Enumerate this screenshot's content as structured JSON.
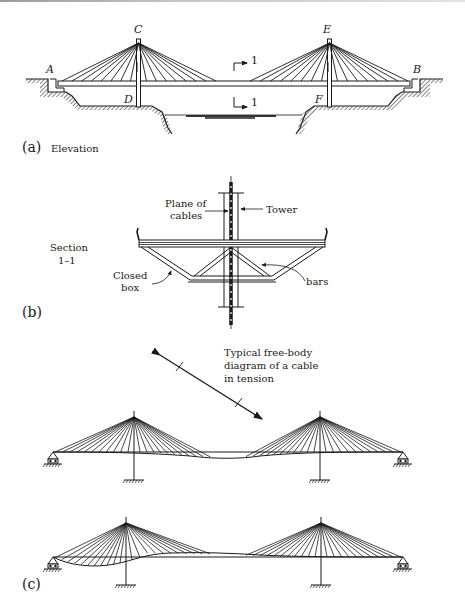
{
  "figure": {
    "panel_a": {
      "tag": "(a)",
      "caption": "Elevation",
      "points": {
        "A": "A",
        "B": "B",
        "C": "C",
        "D": "D",
        "E": "E",
        "F": "F"
      },
      "section_mark_top": "1",
      "section_mark_bottom": "1",
      "cables_per_side": 8
    },
    "panel_b": {
      "tag": "(b)",
      "section_title_line1": "Section",
      "section_title_line2": "1–1",
      "callouts": {
        "plane_of_cables_line1": "Plane of",
        "plane_of_cables_line2": "cables",
        "tower": "Tower",
        "closed_box_line1": "Closed",
        "closed_box_line2": "box",
        "bars": "bars"
      }
    },
    "panel_c": {
      "tag": "(c)",
      "annotation_line1": "Typical free-body",
      "annotation_line2": "diagram of a cable",
      "annotation_line3": "in tension",
      "cables_per_side": 11
    }
  }
}
